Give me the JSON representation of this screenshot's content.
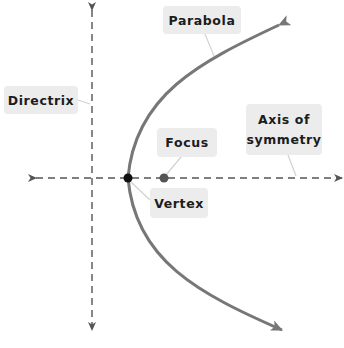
{
  "diagram": {
    "type": "parabola-anatomy",
    "colors": {
      "background": "#ffffff",
      "axis_line": "#555555",
      "parabola_curve": "#777777",
      "vertex_point": "#111111",
      "focus_point": "#555555",
      "label_box": "#ececec",
      "label_text": "#1c1c1c",
      "leader_line": "#cfcfcf"
    },
    "labels": {
      "parabola": "Parabola",
      "directrix": "Directrix",
      "focus": "Focus",
      "axis_of_symmetry_line1": "Axis of",
      "axis_of_symmetry_line2": "symmetry",
      "vertex": "Vertex"
    },
    "elements": [
      {
        "id": "parabola",
        "kind": "curve",
        "opens": "right",
        "arrows": "both ends"
      },
      {
        "id": "directrix",
        "kind": "dashed vertical line",
        "arrows": "both ends"
      },
      {
        "id": "axis_of_symmetry",
        "kind": "dashed horizontal line",
        "arrows": "both ends"
      },
      {
        "id": "vertex",
        "kind": "point",
        "on": "parabola ∩ axis of symmetry"
      },
      {
        "id": "focus",
        "kind": "point",
        "on": "axis of symmetry, inside parabola"
      }
    ]
  }
}
